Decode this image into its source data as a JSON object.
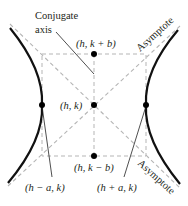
{
  "diagram": {
    "type": "hyperbola-vertical-transverse-horizontal",
    "labels": {
      "conjugate_axis_line1": "Conjugate",
      "conjugate_axis_line2": "axis",
      "top_point": "(h, k + b)",
      "center": "(h, k)",
      "bottom_point": "(h, k − b)",
      "left_vertex": "(h − a, k)",
      "right_vertex": "(h + a, k)",
      "asymptote_upper": "Asymptote",
      "asymptote_lower": "Asymptote"
    },
    "colors": {
      "curve": "#111111",
      "dashed": "#b5b5b5",
      "text": "#231f20"
    }
  }
}
